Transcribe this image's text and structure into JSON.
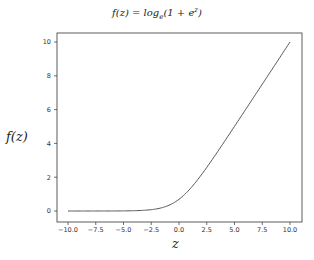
{
  "chart_data": {
    "type": "line",
    "xlabel": "z",
    "ylabel": "f(z)",
    "xlim": [
      -11,
      11
    ],
    "ylim": [
      -0.5,
      10.5
    ],
    "grid": false,
    "legend": null,
    "xticks": [
      "-10.0",
      "-7.5",
      "-5.0",
      "-2.5",
      "0.0",
      "2.5",
      "5.0",
      "7.5",
      "10.0"
    ],
    "yticks": [
      "0",
      "2",
      "4",
      "6",
      "8",
      "10"
    ],
    "series": [
      {
        "name": "softplus",
        "color": "#555555",
        "x": [
          -10,
          -7.5,
          -5,
          -4,
          -3,
          -2,
          -1.5,
          -1,
          -0.5,
          0,
          0.5,
          1,
          1.5,
          2,
          2.5,
          3,
          4,
          5,
          6,
          7.5,
          10
        ],
        "y": [
          4.54e-05,
          0.000553,
          0.0067,
          0.0181,
          0.0486,
          0.127,
          0.201,
          0.313,
          0.474,
          0.693,
          0.974,
          1.313,
          1.701,
          2.127,
          2.579,
          3.049,
          4.018,
          5.007,
          6.002,
          7.5006,
          10.0000454
        ]
      }
    ]
  },
  "labels": {
    "title_main": "f(z) = log",
    "title_sub": "e",
    "title_rest": "(1 + e",
    "title_sup": "z",
    "title_end": ")",
    "ylabel": "f(z)",
    "xlabel": "z"
  }
}
